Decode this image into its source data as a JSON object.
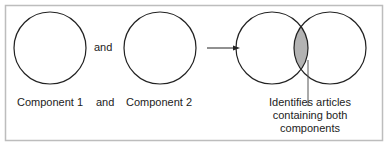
{
  "diagram": {
    "colors": {
      "stroke": "#222222",
      "frame": "#bdbdbd",
      "intersection": "#b3b3b3",
      "background": "#ffffff"
    },
    "between_circles_text": "and",
    "labels": {
      "component1": "Component 1",
      "and": "and",
      "component2": "Component 2"
    },
    "annotation": {
      "line1": "Identifies articles",
      "line2": "containing both",
      "line3": "components"
    }
  }
}
